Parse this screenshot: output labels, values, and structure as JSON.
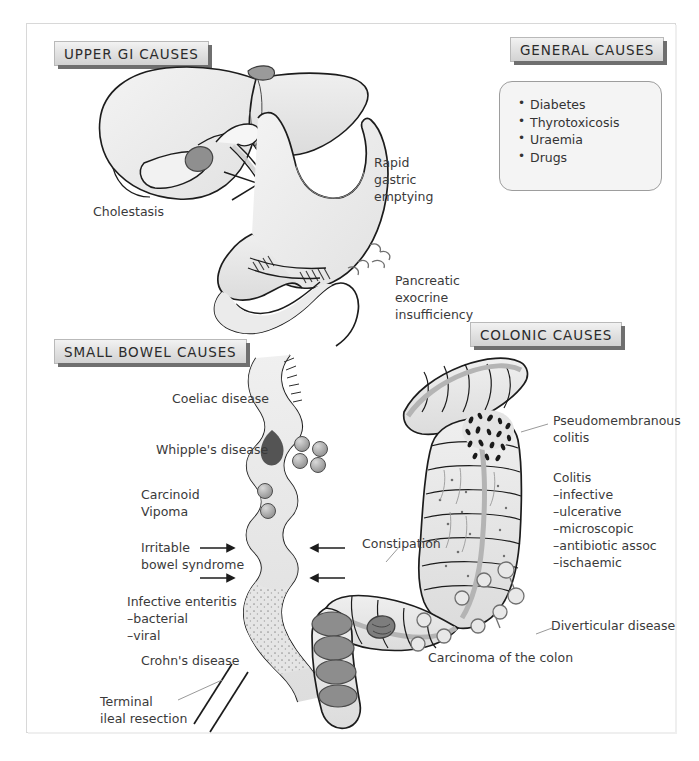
{
  "figure": {
    "title_bar_absent": true,
    "colors": {
      "organ_fill": "#ebebeb",
      "organ_fill_dark": "#d3d3d3",
      "outline": "#1c1c1c",
      "banner_border": "#b9b9b9",
      "banner_shadow": "#6f6f6f",
      "lesion_dark": "#7d7d7d",
      "text": "#3a3a3a",
      "frame_border": "#d8d8d8"
    }
  },
  "banners": {
    "upper_gi": "UPPER GI CAUSES",
    "general": "GENERAL CAUSES",
    "small_bowel": "SMALL BOWEL CAUSES",
    "colonic": "COLONIC CAUSES"
  },
  "general_causes": {
    "items": [
      "Diabetes",
      "Thyrotoxicosis",
      "Uraemia",
      "Drugs"
    ]
  },
  "upper_gi": {
    "labels": {
      "cholestasis": "Cholestasis",
      "rapid_gastric_l1": "Rapid",
      "rapid_gastric_l2": "gastric",
      "rapid_gastric_l3": "emptying",
      "pancreatic_l1": "Pancreatic",
      "pancreatic_l2": "exocrine",
      "pancreatic_l3": "insufficiency"
    }
  },
  "small_bowel": {
    "labels": {
      "coeliac": "Coeliac disease",
      "whipple": "Whipple's disease",
      "carcinoid": "Carcinoid",
      "vipoma": "Vipoma",
      "ibs_l1": "Irritable",
      "ibs_l2": "bowel syndrome",
      "enteritis_l1": "Infective enteritis",
      "enteritis_l2": "–bacterial",
      "enteritis_l3": "–viral",
      "crohns": "Crohn's disease",
      "terminal_l1": "Terminal",
      "terminal_l2": "ileal resection"
    }
  },
  "colonic": {
    "labels": {
      "pseudomembranous_l1": "Pseudomembranous",
      "pseudomembranous_l2": "colitis",
      "colitis_title": "Colitis",
      "colitis_1": "–infective",
      "colitis_2": "–ulcerative",
      "colitis_3": "–microscopic",
      "colitis_4": "–antibiotic assoc",
      "colitis_5": "–ischaemic",
      "constipation": "Constipation",
      "diverticular": "Diverticular disease",
      "carcinoma": "Carcinoma of the colon"
    }
  },
  "icons": {
    "bullet": "bullet-dot",
    "arrow": "arrow-right-icon",
    "resection_marks": "resection-slash-icon",
    "cross_mark": "obstruction-cross-icon"
  }
}
